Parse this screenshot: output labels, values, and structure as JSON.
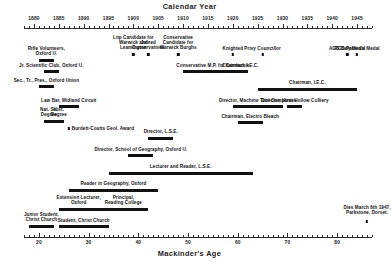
{
  "chart_data": {
    "type": "timeline",
    "title": "Calendar Year",
    "xlabel_top": "Calendar Year",
    "xlabel_bottom": "Mackinder's Age",
    "grid": false,
    "legend": "none",
    "top_axis": {
      "label": "Calendar Year",
      "range": [
        1878,
        1948
      ],
      "tick_step_major": 5,
      "tick_step_minor": 1,
      "ticks": [
        1880,
        1885,
        1890,
        1895,
        1900,
        1905,
        1910,
        1915,
        1920,
        1925,
        1930,
        1935,
        1940,
        1945
      ]
    },
    "bottom_axis": {
      "label": "Mackinder's Age",
      "range": [
        17,
        87
      ],
      "tick_step_major": 10,
      "tick_step_minor": 1,
      "ticks": [
        20,
        30,
        40,
        50,
        60,
        70,
        80
      ]
    },
    "birth_year": 1861,
    "events": [
      {
        "label": "Rifle Volunteers,\nOxford U.",
        "type": "bar",
        "start": 1881.0,
        "end": 1884.0,
        "align": "center"
      },
      {
        "label": "Lnp Candidate for\nWarwick and\nLeamington",
        "type": "point",
        "start": 1900.0,
        "end": 1900.0,
        "align": "center"
      },
      {
        "label": "Joined\nConservatives",
        "type": "point",
        "start": 1903.0,
        "end": 1903.0,
        "align": "center"
      },
      {
        "label": "Conservative\nCandidate for\nWarwick Burghs",
        "type": "point",
        "start": 1909.0,
        "end": 1909.0,
        "align": "center"
      },
      {
        "label": "Knighted",
        "type": "point",
        "start": 1920.0,
        "end": 1920.0,
        "align": "center"
      },
      {
        "label": "Privy Councillor",
        "type": "point",
        "start": 1926.0,
        "end": 1926.0,
        "align": "center"
      },
      {
        "label": "AGS Daly Medal",
        "type": "point",
        "start": 1943.0,
        "end": 1943.0,
        "align": "center"
      },
      {
        "label": "RGS Patron's Medal",
        "type": "point",
        "start": 1945.0,
        "end": 1945.0,
        "align": "center"
      },
      {
        "label": "Jr. Scientific Club, Oxford U.",
        "type": "bar",
        "start": 1882.0,
        "end": 1885.0,
        "align": "center"
      },
      {
        "label": "Conservative M.P. for Camlachie",
        "type": "bar",
        "start": 1910.0,
        "end": 1922.0,
        "align": "center"
      },
      {
        "label": "Chairman, I.E.C.",
        "type": "bar",
        "start": 1920.0,
        "end": 1923.0,
        "align": "center"
      },
      {
        "label": "Sec., Tr., Pres., Oxford Union",
        "type": "bar",
        "start": 1881.0,
        "end": 1884.0,
        "align": "center"
      },
      {
        "label": "Chairman, I.E.C.",
        "type": "bar",
        "start": 1925.0,
        "end": 1945.0,
        "align": "center"
      },
      {
        "label": "Law Bar, Midland Circuit",
        "type": "bar",
        "start": 1885.0,
        "end": 1889.0,
        "align": "center"
      },
      {
        "label": "Director, Machine Tool Companies",
        "type": "bar",
        "start": 1920.0,
        "end": 1930.0,
        "align": "center"
      },
      {
        "label": "Director, Hirst Hollow Colliery",
        "type": "bar",
        "start": 1931.0,
        "end": 1934.0,
        "align": "center"
      },
      {
        "label": "Nat. Sc.\nDegree",
        "type": "bar",
        "start": 1882.0,
        "end": 1884.0,
        "align": "center"
      },
      {
        "label": "Hist.\nDegree",
        "type": "bar",
        "start": 1884.0,
        "end": 1886.0,
        "align": "center"
      },
      {
        "label": "Burdett-Coutts Geol. Award",
        "type": "point",
        "start": 1887.0,
        "end": 1887.0,
        "align": "left"
      },
      {
        "label": "Chairman, Electro Bleach",
        "type": "bar",
        "start": 1921.0,
        "end": 1926.0,
        "align": "center"
      },
      {
        "label": "Director, L.S.E.",
        "type": "bar",
        "start": 1903.0,
        "end": 1908.0,
        "align": "center"
      },
      {
        "label": "Director, School of Geography, Oxford U.",
        "type": "bar",
        "start": 1899.0,
        "end": 1904.0,
        "align": "center"
      },
      {
        "label": "Lecturer and Reader, L.S.E.",
        "type": "bar",
        "start": 1895.0,
        "end": 1924.0,
        "align": "center"
      },
      {
        "label": "Reader in Geography, Oxford",
        "type": "bar",
        "start": 1887.0,
        "end": 1905.0,
        "align": "center"
      },
      {
        "label": "Extension Lecturer,\nOxford",
        "type": "bar",
        "start": 1885.0,
        "end": 1893.0,
        "align": "center"
      },
      {
        "label": "Principal,\nReading College",
        "type": "bar",
        "start": 1893.0,
        "end": 1903.0,
        "align": "center"
      },
      {
        "label": "Junior Student,\nChrist Church",
        "type": "bar",
        "start": 1879.0,
        "end": 1884.0,
        "align": "center"
      },
      {
        "label": "Student, Christ Church",
        "type": "bar",
        "start": 1885.0,
        "end": 1895.0,
        "align": "center"
      },
      {
        "label": "Dies March 6th 1947,\nParkstone, Dorset.",
        "type": "point",
        "start": 1947.0,
        "end": 1947.0,
        "align": "center"
      }
    ]
  },
  "colors": {
    "bar": "#111111",
    "axis": "#2a2a2a",
    "text": "#111111",
    "background": "#ffffff"
  }
}
